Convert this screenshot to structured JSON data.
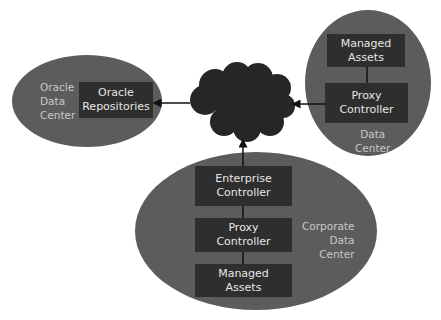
{
  "diagram": {
    "colors": {
      "background": "#ffffff",
      "ellipse_fill": "#5c5c5c",
      "box_fill": "#2e2e2e",
      "box_text": "#e6e6e6",
      "region_label": "#c8c8c8",
      "cloud_fill": "#262626",
      "connector": "#111111"
    },
    "cloud": {
      "name": "internet-cloud"
    },
    "regions": {
      "oracle": {
        "label": "Oracle\nData\nCenter",
        "boxes": {
          "repositories": "Oracle\nRepositories"
        }
      },
      "remote": {
        "label": "Data\nCenter",
        "boxes": {
          "managed_assets": "Managed\nAssets",
          "proxy_controller": "Proxy\nController"
        }
      },
      "corporate": {
        "label": "Corporate\nData\nCenter",
        "boxes": {
          "enterprise_controller": "Enterprise\nController",
          "proxy_controller": "Proxy\nController",
          "managed_assets": "Managed\nAssets"
        }
      }
    },
    "connections": [
      {
        "from": "cloud",
        "to": "Oracle Repositories",
        "arrow": "to"
      },
      {
        "from": "Proxy Controller (Data Center)",
        "to": "cloud",
        "arrow": "to"
      },
      {
        "from": "Enterprise Controller",
        "to": "cloud",
        "arrow": "to"
      },
      {
        "from": "Proxy Controller (Data Center)",
        "to": "Managed Assets (Data Center)",
        "arrow": "none"
      },
      {
        "from": "Enterprise Controller",
        "to": "Proxy Controller (Corporate)",
        "arrow": "none"
      },
      {
        "from": "Proxy Controller (Corporate)",
        "to": "Managed Assets (Corporate)",
        "arrow": "none"
      }
    ]
  }
}
